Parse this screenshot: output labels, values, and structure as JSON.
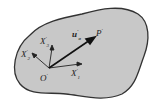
{
  "diagram": {
    "type": "continuum-body-coordinate-frame",
    "body_fill": "#c8c8c8",
    "outline_color": "#333333",
    "labels": {
      "x1": {
        "base": "X",
        "sup": "'",
        "sub": "1"
      },
      "x2": {
        "base": "X",
        "sup": "'",
        "sub": "2"
      },
      "x3": {
        "base": "X",
        "sup": "'",
        "sub": "3"
      },
      "origin": {
        "base": "O",
        "sup": "'"
      },
      "vector": {
        "base": "u",
        "sup": "'",
        "sub": "o"
      },
      "point": {
        "base": "P",
        "sup": "'"
      }
    }
  }
}
